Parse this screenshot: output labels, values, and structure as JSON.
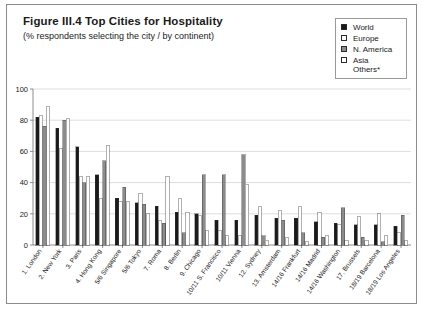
{
  "figure": {
    "title": "Figure III.4  Top Cities for Hospitality",
    "subtitle": "(% respondents selecting the city / by continent)"
  },
  "legend": {
    "position": "top-right",
    "items": [
      {
        "label": "World",
        "color": "#1a1a1a",
        "name": "legend-world"
      },
      {
        "label": "Europe",
        "color": "#ffffff",
        "name": "legend-europe"
      },
      {
        "label": "N. America",
        "color": "#8c8c8c",
        "name": "legend-n-america"
      },
      {
        "label": "Asia\nOthers*",
        "color": "#ffffff",
        "name": "legend-asia-others"
      }
    ]
  },
  "chart_data": {
    "type": "bar",
    "title": "Figure III.4  Top Cities for Hospitality",
    "subtitle": "(% respondents selecting the city / by continent)",
    "xlabel": "",
    "ylabel": "",
    "ylim": [
      0,
      100
    ],
    "yticks": [
      0,
      20,
      40,
      60,
      80,
      100
    ],
    "grid": true,
    "legend_position": "top-right",
    "categories": [
      "1. London",
      "2. New York",
      "3. Paris",
      "4. Hong Kong",
      "5/6 Singapore",
      "5/6 Tokyo",
      "7. Roma",
      "8. Berlin",
      "9. Chicago",
      "10/11 S. Francisco",
      "10/11 Vienna",
      "12. Sydney",
      "13. Amsterdam",
      "14/16 Frankfurt",
      "14/16 Madrid",
      "14/16 Washington",
      "17. Brussels",
      "18/19 Barcelona",
      "18/19 Los Angeles"
    ],
    "series": [
      {
        "name": "World",
        "color": "#1a1a1a",
        "values": [
          82,
          75,
          63,
          45,
          30,
          27,
          25,
          21,
          20,
          16,
          16,
          19,
          17,
          17,
          15,
          14,
          13,
          13,
          12
        ]
      },
      {
        "name": "Europe",
        "color": "#ffffff",
        "values": [
          83,
          62,
          44,
          30,
          28,
          33,
          16,
          30,
          19,
          9,
          6,
          25,
          22,
          25,
          21,
          13,
          18,
          20,
          8
        ]
      },
      {
        "name": "N. America",
        "color": "#8c8c8c",
        "values": [
          76,
          80,
          40,
          54,
          37,
          26,
          14,
          8,
          45,
          45,
          58,
          6,
          16,
          8,
          5,
          24,
          5,
          2,
          19
        ]
      },
      {
        "name": "Asia Others*",
        "color": "#ffffff",
        "values": [
          89,
          81,
          44,
          64,
          28,
          20,
          44,
          21,
          9,
          6,
          39,
          3,
          5,
          2,
          6,
          3,
          3,
          6,
          3
        ]
      }
    ]
  }
}
